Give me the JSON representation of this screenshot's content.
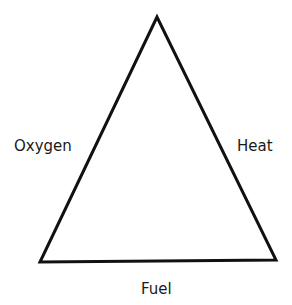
{
  "diagram": {
    "sides": {
      "left": "Oxygen",
      "right": "Heat",
      "bottom": "Fuel"
    },
    "stroke_color": "#111111",
    "background": "#ffffff"
  }
}
